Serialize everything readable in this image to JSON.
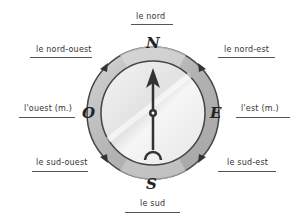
{
  "diagram": {
    "center": {
      "x": 153,
      "y": 113
    },
    "colors": {
      "ring": "#b9b9b9",
      "ring_light": "#dcdcdc",
      "dial": "#eeeeee",
      "needle": "#333333",
      "outline": "#555555"
    },
    "cardinal_letters": {
      "north": "N",
      "south": "S",
      "east": "E",
      "west": "O"
    },
    "labels": {
      "nord": "le nord",
      "nord_ouest": "le nord-ouest",
      "nord_est": "le nord-est",
      "ouest": "l'ouest (m.)",
      "est": "l'est (m.)",
      "sud_ouest": "le sud-ouest",
      "sud_est": "le sud-est",
      "sud": "le sud"
    }
  }
}
